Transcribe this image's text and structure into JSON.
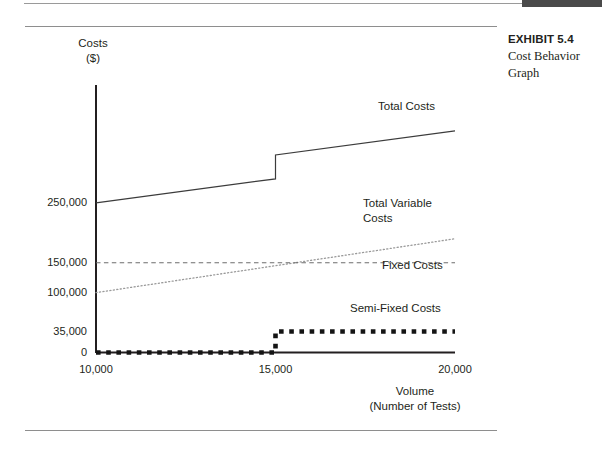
{
  "exhibit": {
    "number": "EXHIBIT 5.4",
    "title_line1": "Cost Behavior",
    "title_line2": "Graph"
  },
  "chart_data": {
    "type": "line",
    "title": "Cost Behavior Graph",
    "xlabel_line1": "Volume",
    "xlabel_line2": "(Number of Tests)",
    "ylabel_line1": "Costs",
    "ylabel_line2": "($)",
    "xlim": [
      10000,
      20000
    ],
    "ylim": [
      0,
      400000
    ],
    "grid": false,
    "legend_position": "inline-right-of-series",
    "xticks": [
      "10,000",
      "15,000",
      "20,000"
    ],
    "xtick_values": [
      10000,
      15000,
      20000
    ],
    "yticks": [
      "250,000",
      "150,000",
      "100,000",
      "35,000",
      "0"
    ],
    "ytick_values": [
      250000,
      150000,
      100000,
      35000,
      0
    ],
    "series": [
      {
        "name": "Total Costs",
        "style": "solid",
        "note": "step increase at 15,000 tests",
        "x": [
          10000,
          15000,
          15000,
          20000
        ],
        "values": [
          250000,
          290000,
          330000,
          370000
        ]
      },
      {
        "name": "Total Variable Costs",
        "style": "dotted",
        "x": [
          10000,
          20000
        ],
        "values": [
          100000,
          190000
        ]
      },
      {
        "name": "Fixed Costs",
        "style": "dashed",
        "x": [
          10000,
          20000
        ],
        "values": [
          150000,
          150000
        ]
      },
      {
        "name": "Semi-Fixed Costs",
        "style": "square-dotted-step",
        "note": "steps from 0 to 35,000 at 15,000 tests",
        "x": [
          10000,
          15000,
          15000,
          20000
        ],
        "values": [
          0,
          0,
          35000,
          35000
        ]
      }
    ],
    "colors": {
      "axis": "#231f20",
      "total_costs": "#3c3c3c",
      "total_variable_costs": "#8c8c8c",
      "fixed_costs": "#6e6e6e",
      "semi_fixed_costs": "#1a1a1a",
      "text": "#231f20",
      "rule": "#8e8e8e",
      "top_bar": "#4a4a4a"
    }
  }
}
